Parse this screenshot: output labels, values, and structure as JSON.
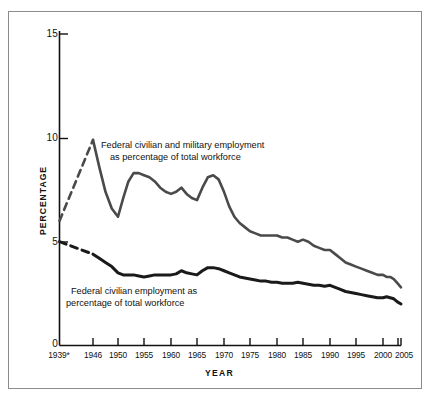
{
  "chart_data": {
    "type": "line",
    "title": "",
    "xlabel": "YEAR",
    "ylabel": "PERCENTAGE",
    "xlim": [
      1939,
      2005
    ],
    "ylim": [
      0,
      15
    ],
    "yticks": [
      0,
      5,
      10,
      15
    ],
    "ytick_labels": [
      "0",
      "5",
      "10",
      "15"
    ],
    "xticks": [
      1939,
      1946,
      1950,
      1955,
      1960,
      1965,
      1970,
      1975,
      1980,
      1985,
      1990,
      1995,
      2000,
      2005
    ],
    "xtick_labels": [
      "1939*",
      "1946",
      "1950",
      "1955",
      "1960",
      "1965",
      "1970",
      "1975",
      "1980",
      "1985",
      "1990",
      "1995",
      "2000",
      "2005"
    ],
    "grid": false,
    "legend": "inline-annotations",
    "series": [
      {
        "name": "Federal civilian and military employment as percentage of total workforce",
        "color": "#4a4a4a",
        "width": 2.6,
        "dashed_segment": {
          "note": "1939 to 1946 drawn as dashed line",
          "x": [
            1939,
            1946
          ],
          "y": [
            6.0,
            9.9
          ]
        },
        "x": [
          1946,
          1947,
          1948,
          1949,
          1950,
          1951,
          1952,
          1953,
          1954,
          1955,
          1956,
          1957,
          1958,
          1959,
          1960,
          1961,
          1962,
          1963,
          1964,
          1965,
          1966,
          1967,
          1968,
          1969,
          1970,
          1971,
          1972,
          1973,
          1974,
          1975,
          1976,
          1977,
          1978,
          1979,
          1980,
          1981,
          1982,
          1983,
          1984,
          1985,
          1986,
          1987,
          1988,
          1989,
          1990,
          1991,
          1992,
          1993,
          1994,
          1995,
          1996,
          1997,
          1998,
          1999,
          2000,
          2001,
          2002,
          2003,
          2004,
          2005
        ],
        "y": [
          9.9,
          8.6,
          7.4,
          6.6,
          6.2,
          7.1,
          7.9,
          8.3,
          8.3,
          8.2,
          8.1,
          7.9,
          7.6,
          7.4,
          7.3,
          7.4,
          7.6,
          7.3,
          7.1,
          7.0,
          7.6,
          8.1,
          8.2,
          8.0,
          7.4,
          6.7,
          6.2,
          5.9,
          5.7,
          5.5,
          5.4,
          5.3,
          5.3,
          5.3,
          5.3,
          5.2,
          5.2,
          5.1,
          5.0,
          5.1,
          5.0,
          4.8,
          4.7,
          4.6,
          4.6,
          4.4,
          4.2,
          4.0,
          3.9,
          3.8,
          3.7,
          3.6,
          3.5,
          3.4,
          3.4,
          3.3,
          3.3,
          3.2,
          3.0,
          2.8
        ]
      },
      {
        "name": "Federal civilian employment as percentage of total workforce",
        "color": "#1a1a1a",
        "width": 3.0,
        "dashed_segment": {
          "note": "1939 to 1946 drawn as dashed line",
          "x": [
            1939,
            1946
          ],
          "y": [
            5.0,
            4.4
          ]
        },
        "x": [
          1946,
          1947,
          1948,
          1949,
          1950,
          1951,
          1952,
          1953,
          1954,
          1955,
          1956,
          1957,
          1958,
          1959,
          1960,
          1961,
          1962,
          1963,
          1964,
          1965,
          1966,
          1967,
          1968,
          1969,
          1970,
          1971,
          1972,
          1973,
          1974,
          1975,
          1976,
          1977,
          1978,
          1979,
          1980,
          1981,
          1982,
          1983,
          1984,
          1985,
          1986,
          1987,
          1988,
          1989,
          1990,
          1991,
          1992,
          1993,
          1994,
          1995,
          1996,
          1997,
          1998,
          1999,
          2000,
          2001,
          2002,
          2003,
          2004,
          2005
        ],
        "y": [
          4.4,
          4.2,
          4.0,
          3.8,
          3.5,
          3.4,
          3.4,
          3.4,
          3.35,
          3.3,
          3.35,
          3.4,
          3.4,
          3.4,
          3.4,
          3.45,
          3.6,
          3.5,
          3.45,
          3.4,
          3.6,
          3.75,
          3.75,
          3.7,
          3.6,
          3.5,
          3.4,
          3.3,
          3.25,
          3.2,
          3.15,
          3.1,
          3.1,
          3.05,
          3.05,
          3.0,
          3.0,
          3.0,
          3.05,
          3.0,
          2.95,
          2.9,
          2.9,
          2.85,
          2.9,
          2.8,
          2.7,
          2.6,
          2.55,
          2.5,
          2.45,
          2.4,
          2.35,
          2.3,
          2.3,
          2.35,
          2.3,
          2.25,
          2.1,
          2.0
        ]
      }
    ],
    "annotations": [
      {
        "id": "annotation-upper",
        "line1": "Federal civilian and military employment",
        "line2": "as percentage of total workforce"
      },
      {
        "id": "annotation-lower",
        "line1": "Federal civilian employment as",
        "line2": "percentage of total workforce"
      }
    ],
    "footnote_marker": "*",
    "colors": {
      "axis": "#111111",
      "frame": "#8c8c8c",
      "series_upper": "#4a4a4a",
      "series_lower": "#1a1a1a",
      "background": "#ffffff"
    }
  }
}
